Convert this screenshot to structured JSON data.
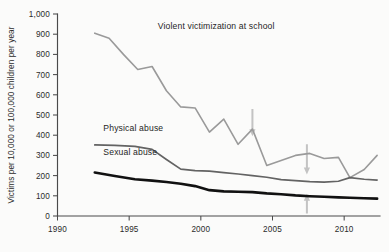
{
  "chart_data": {
    "type": "line",
    "title": "",
    "xlabel": "",
    "ylabel": "Victims per 10,000 or 100,000 children per year",
    "xlim": [
      1990,
      2012.5
    ],
    "ylim": [
      0,
      1000
    ],
    "grid": false,
    "legend": "inline-labels",
    "x_ticks": [
      1990,
      1995,
      2000,
      2005,
      2010
    ],
    "x_tick_labels": [
      "1990",
      "1995",
      "2000",
      "2005",
      "2010"
    ],
    "y_ticks": [
      0,
      100,
      200,
      300,
      400,
      500,
      600,
      700,
      800,
      900,
      1000
    ],
    "y_tick_labels": [
      "0",
      "100",
      "200",
      "300",
      "400",
      "500",
      "600",
      "700",
      "800",
      "900",
      "1,000"
    ],
    "series": [
      {
        "name": "Violent victimization at school",
        "color": "#9a9a9a",
        "label_x": 1997.0,
        "label_y": 925,
        "x": [
          1992.6,
          1993.6,
          1994.6,
          1995.6,
          1996.6,
          1997.6,
          1998.6,
          1999.6,
          2000.6,
          2001.6,
          2002.6,
          2003.6,
          2004.6,
          2005.6,
          2006.6,
          2007.6,
          2008.6,
          2009.6,
          2010.4,
          2011.4,
          2012.3
        ],
        "y": [
          905,
          880,
          800,
          725,
          740,
          620,
          540,
          535,
          415,
          480,
          355,
          430,
          250,
          275,
          300,
          310,
          285,
          290,
          190,
          230,
          300
        ]
      },
      {
        "name": "Physical abuse",
        "color": "#636363",
        "label_x": 1993.2,
        "label_y": 420,
        "x": [
          1992.6,
          1994.0,
          1995.4,
          1996.6,
          1997.6,
          1998.6,
          1999.6,
          2000.6,
          2001.6,
          2002.6,
          2003.6,
          2004.6,
          2005.6,
          2006.6,
          2007.6,
          2008.6,
          2009.6,
          2010.4,
          2011.4,
          2012.3
        ],
        "y": [
          352,
          350,
          345,
          330,
          280,
          232,
          225,
          222,
          215,
          208,
          200,
          192,
          180,
          175,
          170,
          168,
          172,
          190,
          182,
          178
        ]
      },
      {
        "name": "Sexual abuse",
        "color": "#111111",
        "label_x": 1993.2,
        "label_y": 300,
        "x": [
          1992.6,
          1994.0,
          1995.4,
          1996.6,
          1997.6,
          1998.6,
          1999.6,
          2000.6,
          2001.6,
          2002.6,
          2003.6,
          2004.6,
          2005.6,
          2006.6,
          2007.6,
          2008.6,
          2009.6,
          2010.4,
          2011.4,
          2012.3
        ],
        "y": [
          215,
          198,
          182,
          175,
          168,
          160,
          148,
          128,
          122,
          120,
          118,
          112,
          108,
          102,
          98,
          95,
          92,
          90,
          88,
          86
        ]
      }
    ],
    "annotations": [
      {
        "name": "arrow-2003-down",
        "direction": "down",
        "x": 2003.6,
        "y_top": 530,
        "y_bottom": 395
      },
      {
        "name": "arrow-2007-down",
        "direction": "down",
        "x": 2007.4,
        "y_top": 355,
        "y_bottom": 205
      },
      {
        "name": "arrow-2007-up",
        "direction": "up",
        "x": 2007.4,
        "y_top": 110,
        "y_bottom": 12
      }
    ]
  }
}
